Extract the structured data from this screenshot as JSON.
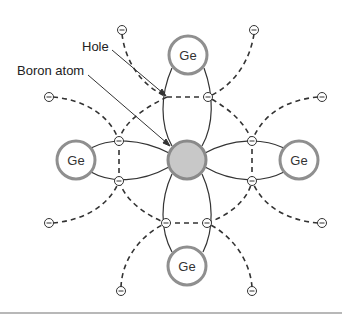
{
  "diagram": {
    "labels": {
      "hole": "Hole",
      "boron": "Boron atom"
    },
    "atoms": [
      {
        "id": "boron",
        "label": "",
        "x": 187,
        "y": 160,
        "fill": "#c8c8c8",
        "stroke": "#8a8a8a"
      },
      {
        "id": "ge-top",
        "label": "Ge",
        "x": 188,
        "y": 55,
        "fill": "#ffffff",
        "stroke": "#8f8f8f"
      },
      {
        "id": "ge-left",
        "label": "Ge",
        "x": 76,
        "y": 160,
        "fill": "#ffffff",
        "stroke": "#8f8f8f"
      },
      {
        "id": "ge-right",
        "label": "Ge",
        "x": 299,
        "y": 160,
        "fill": "#ffffff",
        "stroke": "#8f8f8f"
      },
      {
        "id": "ge-bottom",
        "label": "Ge",
        "x": 187,
        "y": 266,
        "fill": "#ffffff",
        "stroke": "#8f8f8f"
      }
    ],
    "electron_symbol": "−",
    "hole": {
      "x": 167,
      "y": 97
    },
    "bond_electrons": [
      {
        "x": 208,
        "y": 97
      },
      {
        "x": 119,
        "y": 141
      },
      {
        "x": 119,
        "y": 181
      },
      {
        "x": 252,
        "y": 141
      },
      {
        "x": 252,
        "y": 181
      },
      {
        "x": 166,
        "y": 223
      },
      {
        "x": 207,
        "y": 223
      }
    ],
    "outer_electrons": [
      {
        "x": 122,
        "y": 30
      },
      {
        "x": 254,
        "y": 30
      },
      {
        "x": 49,
        "y": 97
      },
      {
        "x": 322,
        "y": 97
      },
      {
        "x": 49,
        "y": 223
      },
      {
        "x": 322,
        "y": 223
      },
      {
        "x": 121,
        "y": 291
      },
      {
        "x": 252,
        "y": 291
      }
    ],
    "colors": {
      "line": "#333333",
      "atom_stroke": "#8f8f8f",
      "boron_fill": "#c8c8c8",
      "divider": "#b8b8b8"
    }
  }
}
